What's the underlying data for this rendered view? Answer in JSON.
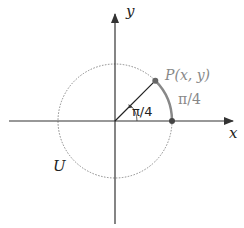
{
  "diagram": {
    "axes": {
      "x_label": "x",
      "y_label": "y"
    },
    "circle": {
      "label": "U",
      "style": "dotted"
    },
    "point": {
      "label": "P(x, y)"
    },
    "angle": {
      "label": "π/4"
    },
    "arc": {
      "label": "π/4"
    },
    "colors": {
      "axis": "#333333",
      "circle": "#888888",
      "arc": "#888888",
      "point": "#666666",
      "point_label": "#888888",
      "text": "#222222"
    }
  }
}
